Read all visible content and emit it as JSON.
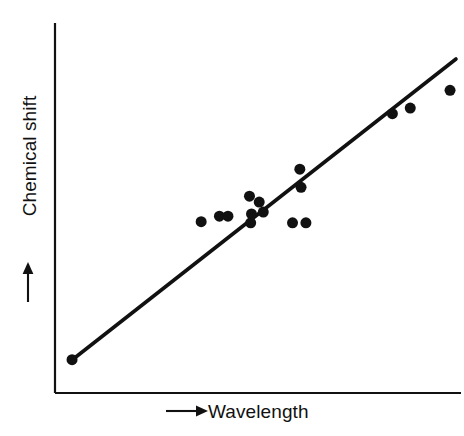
{
  "chart_data": {
    "type": "scatter",
    "title": "",
    "xlabel": "Wavelength",
    "ylabel": "Chemical shift",
    "xlabel_arrow": "→",
    "ylabel_arrow": "→",
    "xlim": [
      0,
      100
    ],
    "ylim": [
      0,
      100
    ],
    "grid": false,
    "legend": null,
    "axis_ticks": "none",
    "axis_color": "#111111",
    "marker_color": "#111111",
    "line_color": "#111111",
    "marker_shape": "circle",
    "marker_size_px": 11,
    "points": [
      {
        "x": 4.2,
        "y": 9.0
      },
      {
        "x": 36.0,
        "y": 46.3
      },
      {
        "x": 40.5,
        "y": 47.8
      },
      {
        "x": 42.6,
        "y": 47.8
      },
      {
        "x": 47.9,
        "y": 53.2
      },
      {
        "x": 48.4,
        "y": 48.4
      },
      {
        "x": 48.2,
        "y": 46.0
      },
      {
        "x": 50.3,
        "y": 51.6
      },
      {
        "x": 51.3,
        "y": 48.9
      },
      {
        "x": 58.5,
        "y": 46.0
      },
      {
        "x": 61.8,
        "y": 46.0
      },
      {
        "x": 60.3,
        "y": 60.5
      },
      {
        "x": 60.6,
        "y": 55.6
      },
      {
        "x": 83.1,
        "y": 75.5
      },
      {
        "x": 87.5,
        "y": 77.0
      },
      {
        "x": 97.3,
        "y": 81.8
      }
    ],
    "trendline": {
      "description": "best-fit straight line",
      "x_start": 4.2,
      "y_start": 9.0,
      "x_end": 100.0,
      "y_end": 90.5
    }
  }
}
